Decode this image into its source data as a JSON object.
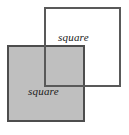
{
  "figure": {
    "canvas": {
      "width": 129,
      "height": 135,
      "background_color": "#ffffff"
    },
    "palette": {
      "fill_gray": "#bfbfbf",
      "fill_white": "#ffffff",
      "stroke": "#4d4d4d",
      "label_color": "#1a1a1a"
    },
    "shapes": [
      {
        "id": "outline-square",
        "kind": "square",
        "label": "square",
        "fill": "#ffffff",
        "stroke": "#4d4d4d",
        "stroke_width": 2,
        "x": 44,
        "y": 7,
        "width": 77,
        "height": 80,
        "z_order": 1
      },
      {
        "id": "filled-square",
        "kind": "square",
        "label": "square",
        "fill": "#bfbfbf",
        "stroke": "#4d4d4d",
        "stroke_width": 2,
        "x": 7,
        "y": 45,
        "width": 78,
        "height": 77,
        "z_order": 2
      }
    ],
    "labels": {
      "outline_square": "square",
      "filled_square": "square"
    }
  },
  "chart_data": {
    "type": "diagram",
    "shape_count": 2,
    "categories": [
      "outline-square",
      "filled-square"
    ],
    "values": [
      77,
      78
    ],
    "series": [
      {
        "name": "side_length_px",
        "values": [
          77,
          78
        ]
      }
    ],
    "annotations": [
      "square",
      "square"
    ],
    "xlabel": "",
    "ylabel": ""
  }
}
